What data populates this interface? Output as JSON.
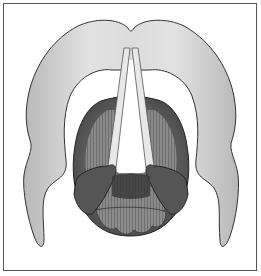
{
  "figure": {
    "colors": {
      "frame": "#555555",
      "cartilage_light": "#d9d9d9",
      "cartilage_shade": "#b5b5b5",
      "outline": "#333333",
      "muscle_dark": "#4a4a4a",
      "muscle_mid": "#7a7a7a",
      "vocal_fold": "#e6e6e6",
      "background": "#ffffff"
    }
  }
}
